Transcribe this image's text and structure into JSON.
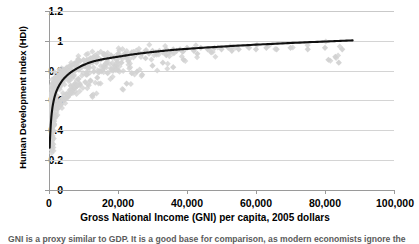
{
  "chart_data": {
    "type": "scatter",
    "title": "",
    "xlabel": "Gross National Income (GNI) per capita, 2005 dollars",
    "ylabel": "Human Development Index (HDI)",
    "xlim": [
      0,
      100000
    ],
    "ylim": [
      0,
      1.2
    ],
    "xticks": [
      "0",
      "20,000",
      "40,000",
      "60,000",
      "80,000",
      "100,000"
    ],
    "xtick_values": [
      0,
      20000,
      40000,
      60000,
      80000,
      100000
    ],
    "yticks": [
      "0",
      "0.2",
      "0.4",
      "0.6",
      "0.8",
      "1",
      "1.2"
    ],
    "ytick_values": [
      0,
      0.2,
      0.4,
      0.6,
      0.8,
      1.0,
      1.2
    ],
    "grid": "horizontal",
    "legend": "none",
    "marker": "diamond",
    "marker_color": "#d2d2d2",
    "curve_color": "#000000",
    "series": [
      {
        "name": "Countries (GNI per capita vs HDI)",
        "type": "scatter",
        "points": [
          [
            300,
            0.31
          ],
          [
            320,
            0.34
          ],
          [
            340,
            0.29
          ],
          [
            360,
            0.38
          ],
          [
            380,
            0.33
          ],
          [
            400,
            0.41
          ],
          [
            420,
            0.36
          ],
          [
            450,
            0.44
          ],
          [
            470,
            0.4
          ],
          [
            500,
            0.47
          ],
          [
            520,
            0.43
          ],
          [
            550,
            0.5
          ],
          [
            580,
            0.46
          ],
          [
            600,
            0.53
          ],
          [
            630,
            0.48
          ],
          [
            660,
            0.55
          ],
          [
            690,
            0.51
          ],
          [
            720,
            0.57
          ],
          [
            750,
            0.52
          ],
          [
            780,
            0.59
          ],
          [
            810,
            0.55
          ],
          [
            850,
            0.61
          ],
          [
            880,
            0.57
          ],
          [
            920,
            0.63
          ],
          [
            960,
            0.58
          ],
          [
            1000,
            0.64
          ],
          [
            1050,
            0.6
          ],
          [
            1100,
            0.66
          ],
          [
            1150,
            0.62
          ],
          [
            1200,
            0.67
          ],
          [
            1250,
            0.63
          ],
          [
            1300,
            0.69
          ],
          [
            1350,
            0.65
          ],
          [
            1400,
            0.7
          ],
          [
            1450,
            0.66
          ],
          [
            1500,
            0.71
          ],
          [
            1600,
            0.67
          ],
          [
            1700,
            0.72
          ],
          [
            1800,
            0.68
          ],
          [
            1900,
            0.73
          ],
          [
            2000,
            0.69
          ],
          [
            2100,
            0.74
          ],
          [
            2200,
            0.7
          ],
          [
            2300,
            0.75
          ],
          [
            2400,
            0.71
          ],
          [
            2500,
            0.76
          ],
          [
            2600,
            0.72
          ],
          [
            2800,
            0.77
          ],
          [
            3000,
            0.73
          ],
          [
            3200,
            0.78
          ],
          [
            3400,
            0.74
          ],
          [
            3600,
            0.79
          ],
          [
            3800,
            0.75
          ],
          [
            4000,
            0.8
          ],
          [
            4200,
            0.76
          ],
          [
            4500,
            0.81
          ],
          [
            4800,
            0.77
          ],
          [
            5000,
            0.82
          ],
          [
            5300,
            0.78
          ],
          [
            5600,
            0.83
          ],
          [
            6000,
            0.79
          ],
          [
            6400,
            0.84
          ],
          [
            6800,
            0.8
          ],
          [
            7200,
            0.85
          ],
          [
            7600,
            0.81
          ],
          [
            8000,
            0.86
          ],
          [
            8500,
            0.82
          ],
          [
            9000,
            0.87
          ],
          [
            9500,
            0.83
          ],
          [
            10000,
            0.88
          ],
          [
            10500,
            0.84
          ],
          [
            11000,
            0.88
          ],
          [
            11500,
            0.85
          ],
          [
            12000,
            0.89
          ],
          [
            12500,
            0.86
          ],
          [
            13000,
            0.9
          ],
          [
            13500,
            0.87
          ],
          [
            14000,
            0.9
          ],
          [
            15000,
            0.88
          ],
          [
            16000,
            0.91
          ],
          [
            17000,
            0.89
          ],
          [
            18000,
            0.91
          ],
          [
            19000,
            0.9
          ],
          [
            20000,
            0.92
          ],
          [
            21000,
            0.9
          ],
          [
            22000,
            0.92
          ],
          [
            23000,
            0.91
          ],
          [
            24000,
            0.93
          ],
          [
            25000,
            0.91
          ],
          [
            26000,
            0.93
          ],
          [
            27000,
            0.92
          ],
          [
            28000,
            0.94
          ],
          [
            29000,
            0.92
          ],
          [
            30000,
            0.94
          ],
          [
            31000,
            0.93
          ],
          [
            32000,
            0.94
          ],
          [
            33000,
            0.93
          ],
          [
            34000,
            0.95
          ],
          [
            35000,
            0.93
          ],
          [
            36000,
            0.95
          ],
          [
            37000,
            0.94
          ],
          [
            38000,
            0.95
          ],
          [
            39000,
            0.94
          ],
          [
            40000,
            0.96
          ],
          [
            42000,
            0.94
          ],
          [
            44000,
            0.96
          ],
          [
            46000,
            0.95
          ],
          [
            48000,
            0.96
          ],
          [
            50000,
            0.95
          ],
          [
            52000,
            0.96
          ],
          [
            55000,
            0.95
          ],
          [
            58000,
            0.96
          ],
          [
            60000,
            0.95
          ],
          [
            63000,
            0.96
          ],
          [
            66000,
            0.95
          ],
          [
            70000,
            0.96
          ],
          [
            75000,
            0.95
          ],
          [
            80000,
            0.96
          ],
          [
            85000,
            0.95
          ],
          [
            22500,
            0.72
          ],
          [
            24000,
            0.79
          ],
          [
            25500,
            0.8
          ],
          [
            27000,
            0.78
          ],
          [
            30000,
            0.84
          ],
          [
            33000,
            0.86
          ],
          [
            36000,
            0.83
          ],
          [
            39000,
            0.88
          ],
          [
            14000,
            0.76
          ],
          [
            15500,
            0.81
          ],
          [
            17000,
            0.79
          ],
          [
            12000,
            0.74
          ],
          [
            9000,
            0.71
          ],
          [
            10500,
            0.73
          ],
          [
            8000,
            0.7
          ],
          [
            7000,
            0.68
          ],
          [
            6000,
            0.66
          ],
          [
            5000,
            0.65
          ],
          [
            4000,
            0.62
          ],
          [
            3000,
            0.6
          ],
          [
            19000,
            0.84
          ],
          [
            21000,
            0.86
          ],
          [
            20000,
            0.81
          ],
          [
            18000,
            0.82
          ],
          [
            81000,
            0.88
          ],
          [
            84000,
            0.86
          ],
          [
            83000,
            0.9
          ],
          [
            12500,
            0.64
          ],
          [
            600,
            0.28
          ],
          [
            700,
            0.3
          ],
          [
            850,
            0.32
          ],
          [
            1000,
            0.35
          ],
          [
            1200,
            0.4
          ],
          [
            1500,
            0.45
          ],
          [
            2000,
            0.5
          ],
          [
            2500,
            0.55
          ],
          [
            3500,
            0.58
          ],
          [
            4500,
            0.61
          ],
          [
            5500,
            0.63
          ],
          [
            6500,
            0.67
          ],
          [
            7500,
            0.72
          ],
          [
            8500,
            0.75
          ],
          [
            11000,
            0.78
          ],
          [
            13000,
            0.8
          ],
          [
            16000,
            0.83
          ],
          [
            23000,
            0.87
          ],
          [
            28000,
            0.89
          ],
          [
            34000,
            0.91
          ],
          [
            43000,
            0.92
          ],
          [
            47000,
            0.93
          ],
          [
            53000,
            0.94
          ]
        ]
      },
      {
        "name": "Fitted logarithmic trend",
        "type": "line",
        "formula": "HDI approx 0.29 at GNI 0, rising logarithmically to about 1.01 at GNI 88,000",
        "points": [
          [
            200,
            0.29
          ],
          [
            400,
            0.4
          ],
          [
            700,
            0.5
          ],
          [
            1000,
            0.56
          ],
          [
            1500,
            0.62
          ],
          [
            2000,
            0.66
          ],
          [
            3000,
            0.71
          ],
          [
            4000,
            0.745
          ],
          [
            5000,
            0.77
          ],
          [
            6000,
            0.79
          ],
          [
            8000,
            0.82
          ],
          [
            10000,
            0.845
          ],
          [
            13000,
            0.87
          ],
          [
            16000,
            0.885
          ],
          [
            20000,
            0.9
          ],
          [
            25000,
            0.918
          ],
          [
            30000,
            0.932
          ],
          [
            35000,
            0.944
          ],
          [
            40000,
            0.953
          ],
          [
            50000,
            0.968
          ],
          [
            60000,
            0.981
          ],
          [
            70000,
            0.992
          ],
          [
            80000,
            1.002
          ],
          [
            88000,
            1.01
          ]
        ]
      }
    ]
  },
  "caption": {
    "text": "GNI is a proxy similar to GDP. It is a good base for comparison, as modern economists ignore the distortion."
  }
}
